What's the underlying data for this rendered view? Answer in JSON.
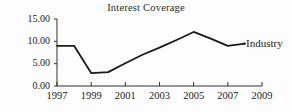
{
  "chart_data": {
    "type": "line",
    "title": "Interest Coverage",
    "xlabel": "",
    "ylabel": "",
    "xlim": [
      1997,
      2009
    ],
    "ylim": [
      0.0,
      15.0
    ],
    "grid": false,
    "legend_position": "right-inline",
    "xtick_labels": [
      "1997",
      "1999",
      "2001",
      "2003",
      "2005",
      "2007",
      "2009"
    ],
    "xtick_values": [
      1997,
      1999,
      2001,
      2003,
      2005,
      2007,
      2009
    ],
    "ytick_labels": [
      "15.00",
      "10.00",
      "5.00",
      "0.00"
    ],
    "ytick_values": [
      15.0,
      10.0,
      5.0,
      0.0
    ],
    "series": [
      {
        "name": "Industry",
        "color": "#1a1a1a",
        "x": [
          1997,
          1998,
          1999,
          2000,
          2001,
          2002,
          2003,
          2004,
          2005,
          2006,
          2007,
          2008
        ],
        "values": [
          9.0,
          9.0,
          2.9,
          3.1,
          5.1,
          7.0,
          8.6,
          10.3,
          12.1,
          10.6,
          9.0,
          9.5
        ]
      }
    ]
  }
}
